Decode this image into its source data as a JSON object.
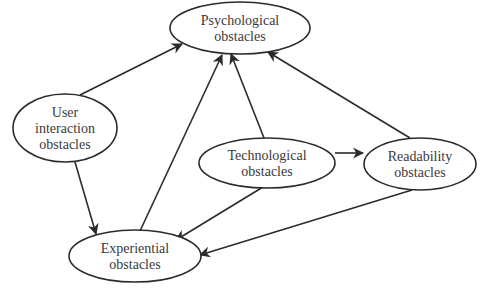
{
  "diagram": {
    "type": "directed-graph",
    "nodes": [
      {
        "id": "psychological",
        "lines": [
          "Psychological",
          "obstacles"
        ],
        "cx": 240,
        "cy": 28,
        "rx": 70,
        "ry": 26
      },
      {
        "id": "user_interaction",
        "lines": [
          "User",
          "interaction",
          "obstacles"
        ],
        "cx": 65,
        "cy": 128,
        "rx": 52,
        "ry": 34
      },
      {
        "id": "technological",
        "lines": [
          "Technological",
          "obstacles"
        ],
        "cx": 267,
        "cy": 163,
        "rx": 68,
        "ry": 25
      },
      {
        "id": "readability",
        "lines": [
          "Readability",
          "obstacles"
        ],
        "cx": 420,
        "cy": 164,
        "rx": 56,
        "ry": 26
      },
      {
        "id": "experiential",
        "lines": [
          "Experiential",
          "obstacles"
        ],
        "cx": 135,
        "cy": 256,
        "rx": 66,
        "ry": 26
      }
    ],
    "edges": [
      {
        "from": "user_interaction",
        "to": "psychological"
      },
      {
        "from": "user_interaction",
        "to": "experiential"
      },
      {
        "from": "technological",
        "to": "psychological"
      },
      {
        "from": "technological",
        "to": "readability"
      },
      {
        "from": "technological",
        "to": "experiential"
      },
      {
        "from": "readability",
        "to": "psychological"
      },
      {
        "from": "readability",
        "to": "experiential"
      },
      {
        "from": "experiential",
        "to": "psychological"
      }
    ]
  }
}
